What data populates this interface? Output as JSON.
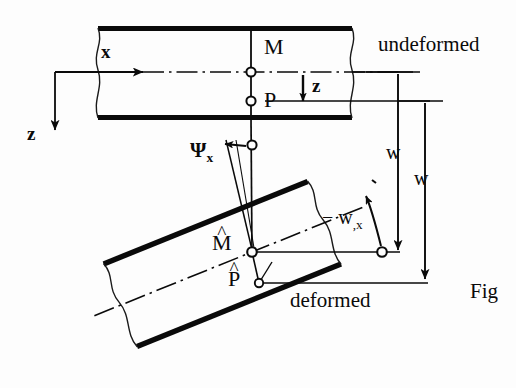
{
  "figure": {
    "kind": "engineering-diagram",
    "caption_fragment": "Fig"
  },
  "labels": {
    "axis_x": "x",
    "axis_z": "z",
    "thickness_z": "z",
    "point_m": "M",
    "point_p": "P",
    "point_m_hat_base": "M",
    "point_p_hat_base": "P",
    "hat_mark": "^",
    "state_undeformed": "undeformed",
    "state_deformed": "deformed",
    "dim_w_upper": "w",
    "dim_w_lower": "w",
    "rotation_psi_base": "Ψ",
    "rotation_psi_sub": "x",
    "slope_minus_w_base": "− w",
    "slope_minus_w_sub": ",x"
  },
  "colors": {
    "ink": "#0a0a0a",
    "paper": "#fdfdfd",
    "thin_line": "#1a1a1a"
  },
  "geometry": {
    "undeformed_beam": {
      "left": 98,
      "right": 352,
      "top": 28,
      "bottom": 118,
      "centerline_y": 72
    },
    "nodes": {
      "M": [
        251,
        72
      ],
      "P": [
        251,
        101
      ],
      "M_hat": [
        252,
        252
      ],
      "P_hat": [
        259,
        283
      ],
      "psi_origin": [
        252,
        145
      ],
      "slope_marker": [
        382,
        252
      ]
    },
    "deformed_rotation_deg": -22,
    "dimension_lines": {
      "w_upper_x": 398,
      "w_upper_from_y": 72,
      "w_upper_to_y": 252,
      "w_lower_x": 425,
      "w_lower_from_y": 101,
      "w_lower_to_y": 281
    }
  }
}
